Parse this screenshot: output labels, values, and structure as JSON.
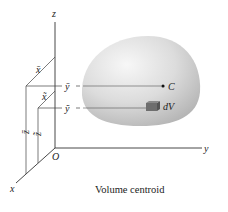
{
  "diagram": {
    "caption": "Volume centroid",
    "axes": {
      "z_label": "z",
      "y_label": "y",
      "x_label": "x",
      "origin_label": "O"
    },
    "centroid": {
      "point_label": "C",
      "x_label": "x̄",
      "y_label": "ȳ",
      "z_label": "z̄"
    },
    "element": {
      "label": "dV",
      "x_label": "x̃",
      "y_label": "ỹ",
      "z_label": "z̃"
    },
    "colors": {
      "lines": "#333333",
      "body_light": "#f2f2f2",
      "body_mid": "#d6d6d6",
      "body_dark": "#b8b8b8",
      "element_fill": "#6e6e6e"
    }
  }
}
